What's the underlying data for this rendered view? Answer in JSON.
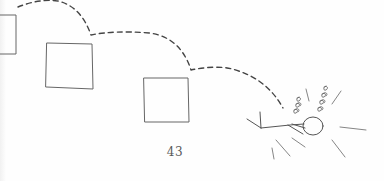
{
  "page": {
    "number": "43",
    "illustration": {
      "description": "Hand-drawn sketch: a dashed trajectory bouncing across three squares ending at a fallen stick figure",
      "elements": [
        "left-square",
        "middle-square",
        "right-square",
        "dashed-trajectory",
        "fallen-stick-figure",
        "dizzy-spirals",
        "impact-lines"
      ]
    },
    "colors": {
      "ink": "#555555",
      "paper": "#fefefe"
    }
  }
}
